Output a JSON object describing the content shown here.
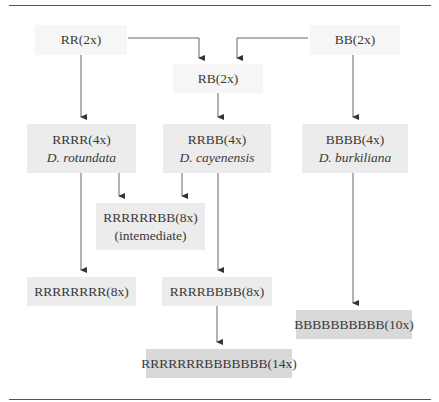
{
  "diagram": {
    "type": "polyploid-genome-lineage",
    "nodes": [
      {
        "id": "rr",
        "genome": "RR(2x)"
      },
      {
        "id": "bb",
        "genome": "BB(2x)"
      },
      {
        "id": "rb",
        "genome": "RB(2x)"
      },
      {
        "id": "rrrr",
        "genome": "RRRR(4x)",
        "species": "D. rotundata"
      },
      {
        "id": "rrbb",
        "genome": "RRBB(4x)",
        "species": "D. cayenensis"
      },
      {
        "id": "bbbb",
        "genome": "BBBB(4x)",
        "species": "D. burkiliana"
      },
      {
        "id": "rrrrrrbb",
        "genome": "RRRRRRBB(8x)",
        "note": "(intemediate)"
      },
      {
        "id": "rrrrrrrr",
        "genome": "RRRRRRRR(8x)"
      },
      {
        "id": "rrrrbbbb",
        "genome": "RRRRBBBB(8x)"
      },
      {
        "id": "bbbbbbbbbb",
        "genome": "BBBBBBBBBB(10x)"
      },
      {
        "id": "rr14",
        "genome": "RRRRRRRBBBBBBB(14x)"
      }
    ],
    "edges": [
      {
        "from": "rr",
        "to": "rb"
      },
      {
        "from": "bb",
        "to": "rb"
      },
      {
        "from": "rr",
        "to": "rrrr"
      },
      {
        "from": "rb",
        "to": "rrbb"
      },
      {
        "from": "bb",
        "to": "bbbb"
      },
      {
        "from": "rrrr",
        "to": "rrrrrrbb"
      },
      {
        "from": "rrbb",
        "to": "rrrrrrbb"
      },
      {
        "from": "rrrr",
        "to": "rrrrrrrr"
      },
      {
        "from": "rrbb",
        "to": "rrrrbbbb"
      },
      {
        "from": "bbbb",
        "to": "bbbbbbbbbb"
      },
      {
        "from": "rrrrbbbb",
        "to": "rr14"
      }
    ],
    "colors": {
      "line": "#555555",
      "box_light": "#f6f6f6",
      "box_mid": "#ececec",
      "box_dark": "#d9d9d9"
    }
  }
}
